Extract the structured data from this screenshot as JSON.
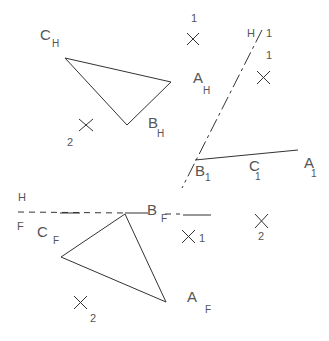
{
  "diagram": {
    "colors": {
      "line": "#333333",
      "text": "#555555",
      "background": "#ffffff"
    },
    "horizontal_view": {
      "labels": {
        "C": "C",
        "C_sub": "H",
        "A": "A",
        "A_sub": "H",
        "B": "B",
        "B_sub": "H"
      },
      "markers": [
        {
          "id": "mark-1",
          "label": "1"
        },
        {
          "id": "mark-2",
          "label": "2"
        }
      ]
    },
    "fold_line_H1": {
      "left": "H",
      "right": "1"
    },
    "auxiliary_view": {
      "labels": {
        "B": "B",
        "B_sub": "1",
        "C": "C",
        "C_sub": "1",
        "A": "A",
        "A_sub": "1"
      },
      "marker_label": "1"
    },
    "fold_line_HF": {
      "top": "H",
      "bottom": "F"
    },
    "frontal_view": {
      "labels": {
        "C": "C",
        "C_sub": "F",
        "B": "B",
        "B_sub": "F",
        "A": "A",
        "A_sub": "F"
      },
      "markers": [
        {
          "id": "mark-1",
          "label": "1"
        },
        {
          "id": "mark-2a",
          "label": "2"
        },
        {
          "id": "mark-2b",
          "label": "2"
        }
      ]
    }
  }
}
